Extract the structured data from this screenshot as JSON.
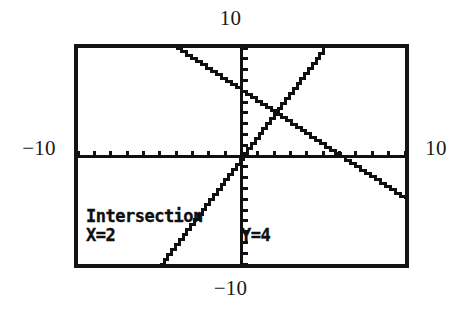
{
  "screen": {
    "device": "graphing-calculator",
    "border_color": "#141414",
    "background_color": "#ffffff",
    "ink_color": "#101010"
  },
  "window_labels": {
    "top": "10",
    "bottom": "−10",
    "left": "−10",
    "right": "10"
  },
  "readout": {
    "title": "Intersection",
    "x_value": "X=2",
    "y_value": "Y=4"
  },
  "chart_data": {
    "type": "line",
    "title": "Intersection",
    "xlabel": "",
    "ylabel": "",
    "xlim": [
      -10,
      10
    ],
    "ylim": [
      -10,
      10
    ],
    "grid": false,
    "axes": {
      "x_axis_at_y": 0,
      "y_axis_at_x": 0,
      "tick_spacing_x": 1,
      "tick_spacing_y": 1,
      "ticks_visible": true
    },
    "legend": "none",
    "series": [
      {
        "name": "descending-line",
        "slope": -1,
        "intercept": 6,
        "x": [
          -4,
          10
        ],
        "y": [
          10,
          -4
        ]
      },
      {
        "name": "ascending-line",
        "slope": 2,
        "intercept": 0,
        "x": [
          -5,
          5
        ],
        "y": [
          -10,
          10
        ]
      }
    ],
    "annotations": [
      {
        "label": "Intersection",
        "x": 2,
        "y": 4,
        "x_text": "X=2",
        "y_text": "Y=4"
      }
    ]
  }
}
